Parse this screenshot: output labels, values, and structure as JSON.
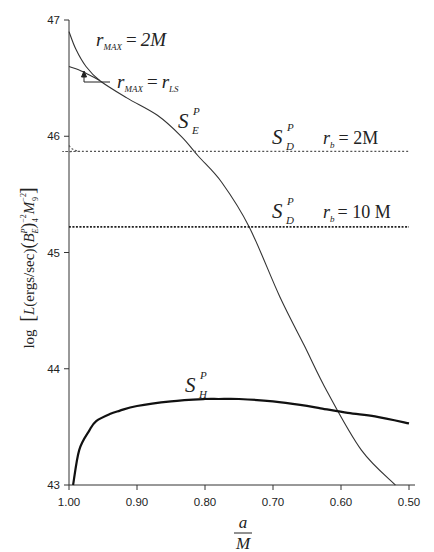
{
  "chart_data": {
    "type": "line",
    "title": "",
    "xlabel": {
      "numerator": "a",
      "denominator": "M"
    },
    "ylabel": "log [L(ergs/sec) (B_E^P)_4^-2 M_9^-2]",
    "xlim": [
      1.0,
      0.5
    ],
    "ylim": [
      43,
      47
    ],
    "x_reversed": true,
    "grid": false,
    "x_ticks": [
      1.0,
      0.9,
      0.8,
      0.7,
      0.6,
      0.5
    ],
    "x_tick_labels": [
      "1.00",
      "0.90",
      "0.80",
      "0.70",
      "0.60",
      "0.50"
    ],
    "y_ticks": [
      43,
      44,
      45,
      46,
      47
    ],
    "y_tick_labels": [
      "43",
      "44",
      "45",
      "46",
      "47"
    ],
    "series": [
      {
        "name": "S_E^P (r_MAX = 2M)",
        "style": "solid-thin",
        "x": [
          1.0,
          0.99,
          0.975,
          0.955,
          0.915,
          0.87,
          0.835,
          0.81,
          0.775,
          0.735,
          0.69,
          0.654,
          0.62,
          0.57,
          0.52
        ],
        "y": [
          46.9,
          46.75,
          46.6,
          46.48,
          46.33,
          46.18,
          46.0,
          45.83,
          45.6,
          45.22,
          44.62,
          44.2,
          43.8,
          43.3,
          43.0
        ]
      },
      {
        "name": "S_E^P (r_MAX = r_LS)",
        "style": "solid-thin",
        "x": [
          1.0,
          0.985,
          0.968,
          0.955
        ],
        "y": [
          46.6,
          46.57,
          46.52,
          46.48
        ]
      },
      {
        "name": "S_D^P (r_b = 2M)",
        "style": "dotted-light",
        "x": [
          1.0,
          0.995,
          0.985,
          0.97,
          0.5
        ],
        "y": [
          45.92,
          45.89,
          45.87,
          45.87,
          45.87
        ]
      },
      {
        "name": "S_D^P (r_b = 10M)",
        "style": "dotted-heavy",
        "x": [
          1.0,
          0.5
        ],
        "y": [
          45.22,
          45.22
        ]
      },
      {
        "name": "S_H^P",
        "style": "solid-thick",
        "x": [
          0.994,
          0.985,
          0.97,
          0.96,
          0.94,
          0.925,
          0.9,
          0.85,
          0.8,
          0.78,
          0.75,
          0.7,
          0.66,
          0.63,
          0.59,
          0.55,
          0.5
        ],
        "y": [
          43.0,
          43.3,
          43.47,
          43.55,
          43.61,
          43.64,
          43.68,
          43.72,
          43.74,
          43.74,
          43.74,
          43.72,
          43.69,
          43.66,
          43.62,
          43.59,
          43.53
        ]
      }
    ],
    "annotations": [
      {
        "text": "r_MAX = 2M",
        "near": "S_E upper branch"
      },
      {
        "text": "r_MAX = r_LS",
        "near": "S_E lower branch, with arrow"
      },
      {
        "text": "S_E^P",
        "near": "S_E curve"
      },
      {
        "text": "S_D^P  r_b = 2M",
        "near": "upper dotted line"
      },
      {
        "text": "S_D^P  r_b = 10M",
        "near": "lower dotted line"
      },
      {
        "text": "S_H^P",
        "near": "thick curve"
      }
    ]
  },
  "labels": {
    "rmax": {
      "r": "r",
      "sub": "MAX",
      "eq": "=",
      "val2m": "2M",
      "rls_r": "r",
      "rls_sub": "LS"
    },
    "se": {
      "S": "S",
      "sup": "P",
      "sub": "E"
    },
    "sd": {
      "S": "S",
      "sup": "P",
      "sub": "D"
    },
    "sh": {
      "S": "S",
      "sup": "P",
      "sub": "H"
    },
    "rb": {
      "r": "r",
      "sub": "b",
      "eq2m": "= 2M",
      "eq10m": "= 10 M"
    },
    "xlabel": {
      "num": "a",
      "den": "M"
    },
    "ylabel": {
      "log": "log",
      "L": "L",
      "units": "(ergs/sec)",
      "B": "B",
      "Bsup": "P",
      "Bsub": "E",
      "pow": "−2",
      "fourSub": "4",
      "M": "M",
      "Msub": "9",
      "Mpow": "−2"
    }
  }
}
